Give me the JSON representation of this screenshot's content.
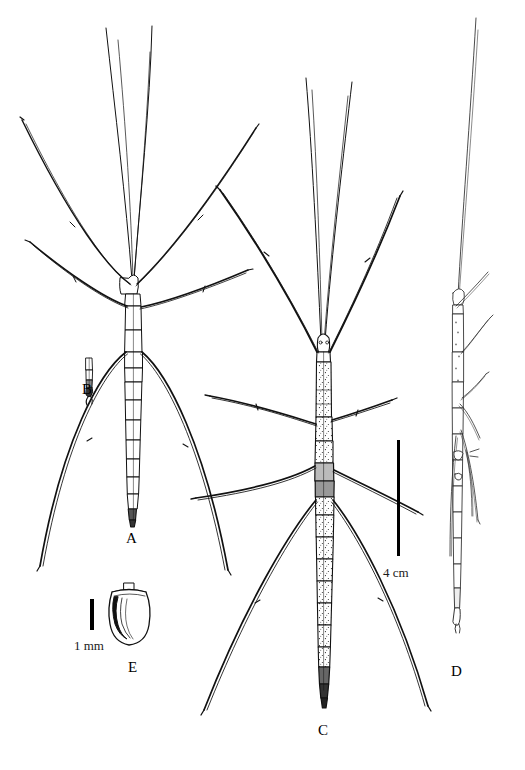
{
  "plate": {
    "title": "Phasmid species plate",
    "background_color": "#ffffff",
    "ink_color": "#000000",
    "width": 525,
    "height": 770
  },
  "figures": [
    {
      "id": "A",
      "label": "A",
      "name": "stick-insect-dorsal-full-left",
      "description": "Whole stick insect in dorsal view, long filiform antennae, three pairs of elongate legs"
    },
    {
      "id": "B",
      "label": "B",
      "name": "terminal-abdominal-segments-detail",
      "description": "Small enlarged detail of terminal abdominal segments"
    },
    {
      "id": "C",
      "label": "C",
      "name": "stick-insect-dorsal-full-center",
      "description": "Whole stick insect in dorsal view with stippled segmented abdomen"
    },
    {
      "id": "D",
      "label": "D",
      "name": "stick-insect-lateral-full-right",
      "description": "Whole stick insect in lateral view with legs folded along body"
    },
    {
      "id": "E",
      "label": "E",
      "name": "egg-capsule-lateral",
      "description": "Egg capsule in lateral view with operculum"
    }
  ],
  "scale_bars": [
    {
      "name": "scale-bar-4cm",
      "label": "4 cm",
      "orientation": "vertical",
      "applies_to": [
        "A",
        "C",
        "D"
      ]
    },
    {
      "name": "scale-bar-1mm",
      "label": "1 mm",
      "orientation": "vertical",
      "applies_to": [
        "E"
      ]
    }
  ]
}
